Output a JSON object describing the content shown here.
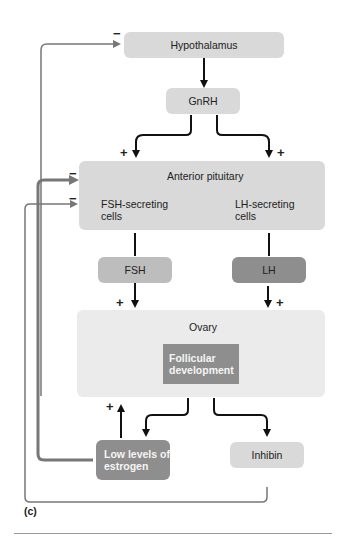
{
  "diagram": {
    "nodes": {
      "hypothalamus": "Hypothalamus",
      "gnrh": "GnRH",
      "anterior_pituitary": "Anterior pituitary",
      "fsh_cells": "FSH-secreting cells",
      "lh_cells": "LH-secreting cells",
      "fsh": "FSH",
      "lh": "LH",
      "ovary": "Ovary",
      "follicular_development": "Follicular development",
      "low_estrogen": "Low levels of estrogen",
      "inhibin": "Inhibin"
    },
    "signs": {
      "plus": "+",
      "minus": "−"
    },
    "panel_label": "(c)",
    "edges": [
      {
        "from": "Hypothalamus",
        "to": "GnRH",
        "sign": ""
      },
      {
        "from": "GnRH",
        "to": "FSH-secreting cells",
        "sign": "+"
      },
      {
        "from": "GnRH",
        "to": "LH-secreting cells",
        "sign": "+"
      },
      {
        "from": "FSH-secreting cells",
        "to": "FSH",
        "sign": ""
      },
      {
        "from": "LH-secreting cells",
        "to": "LH",
        "sign": ""
      },
      {
        "from": "FSH",
        "to": "Ovary",
        "sign": "+"
      },
      {
        "from": "LH",
        "to": "Ovary",
        "sign": "+"
      },
      {
        "from": "Ovary",
        "to": "Low levels of estrogen",
        "sign": ""
      },
      {
        "from": "Ovary",
        "to": "Inhibin",
        "sign": ""
      },
      {
        "from": "Low levels of estrogen",
        "to": "Ovary",
        "sign": "+"
      },
      {
        "from": "Low levels of estrogen",
        "to": "Anterior pituitary",
        "sign": "-"
      },
      {
        "from": "Inhibin",
        "to": "Anterior pituitary",
        "sign": "-"
      },
      {
        "from": "Inhibin",
        "to": "Hypothalamus",
        "sign": "-"
      }
    ]
  }
}
